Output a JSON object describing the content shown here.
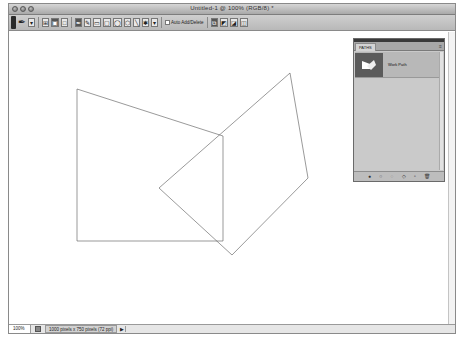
{
  "window": {
    "title": "Untitled-1 @ 100% (RGB/8) *"
  },
  "options_bar": {
    "tools": [
      {
        "name": "pen-tool-icon",
        "glyph": "✒"
      },
      {
        "name": "tool-preset-dropdown",
        "glyph": "▾"
      },
      {
        "name": "shape-layers-button",
        "glyph": "⊞"
      },
      {
        "name": "paths-button",
        "glyph": "▣"
      },
      {
        "name": "fill-pixels-button",
        "glyph": "□"
      },
      {
        "name": "pen-button",
        "glyph": "✒"
      },
      {
        "name": "freeform-pen-button",
        "glyph": "✎"
      },
      {
        "name": "rectangle-button",
        "glyph": "▭"
      },
      {
        "name": "rounded-rectangle-button",
        "glyph": "▢"
      },
      {
        "name": "ellipse-button",
        "glyph": "◯"
      },
      {
        "name": "polygon-button",
        "glyph": "⬡"
      },
      {
        "name": "line-button",
        "glyph": "╲"
      },
      {
        "name": "custom-shape-button",
        "glyph": "✱"
      },
      {
        "name": "geometry-options-button",
        "glyph": "▾"
      }
    ],
    "auto_add_delete_label": "Auto Add/Delete",
    "auto_add_delete_checked": false,
    "path_ops": [
      "⧉",
      "◩",
      "◪",
      "◫"
    ]
  },
  "canvas": {
    "background": "#ffffff",
    "stroke_color": "#555555",
    "paths": [
      {
        "name": "left-quadrilateral",
        "points": "68,57 214,104 214,209 68,209"
      },
      {
        "name": "right-quadrilateral",
        "points": "150,156 281,41 299,146 223,223"
      }
    ]
  },
  "status_bar": {
    "zoom": "100%",
    "doc_info": "1000 pixels x 750 pixels (72 ppi)",
    "arrow": "▶"
  },
  "paths_panel": {
    "tab_label": "PATHS",
    "menu_glyph": "≡",
    "items": [
      {
        "label": "Work Path",
        "selected": true
      }
    ],
    "footer_buttons": [
      {
        "name": "fill-path-button",
        "glyph": "●"
      },
      {
        "name": "stroke-path-button",
        "glyph": "○"
      },
      {
        "name": "load-as-selection-button",
        "glyph": "◌"
      },
      {
        "name": "make-work-path-button",
        "glyph": "◇"
      },
      {
        "name": "new-path-button",
        "glyph": "▫"
      },
      {
        "name": "delete-path-button",
        "glyph": "🗑"
      }
    ]
  }
}
